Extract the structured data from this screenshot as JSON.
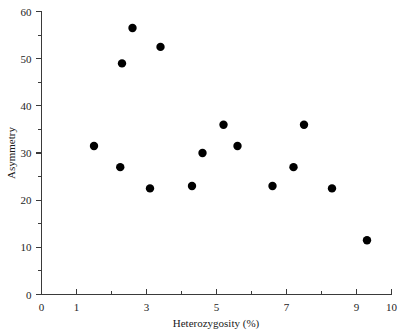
{
  "chart_data": {
    "type": "scatter",
    "title": "",
    "xlabel": "Heterozygosity (%)",
    "ylabel": "Asymmetry",
    "xlim": [
      0,
      10
    ],
    "ylim": [
      0,
      60
    ],
    "grid": false,
    "legend": "none",
    "x_ticks_major": [
      0,
      1,
      3,
      5,
      7,
      9,
      10
    ],
    "x_ticks_all": [
      0,
      1,
      2,
      3,
      4,
      5,
      6,
      7,
      8,
      9,
      10
    ],
    "x_tick_labels": [
      "0",
      "1",
      "3",
      "5",
      "7",
      "9",
      "10"
    ],
    "y_ticks_major": [
      0,
      10,
      20,
      30,
      40,
      50,
      60
    ],
    "y_ticks_minor": [
      5,
      15,
      25,
      35,
      45,
      55
    ],
    "y_tick_labels": [
      "0",
      "10",
      "20",
      "30",
      "40",
      "50",
      "60"
    ],
    "marker": "filled-circle",
    "marker_color": "#000000",
    "marker_size_px": 4.2,
    "points": [
      {
        "x": 1.5,
        "y": 31.5
      },
      {
        "x": 2.25,
        "y": 27.0
      },
      {
        "x": 2.3,
        "y": 49.0
      },
      {
        "x": 2.6,
        "y": 56.5
      },
      {
        "x": 3.1,
        "y": 22.5
      },
      {
        "x": 3.4,
        "y": 52.5
      },
      {
        "x": 4.3,
        "y": 23.0
      },
      {
        "x": 4.6,
        "y": 30.0
      },
      {
        "x": 5.2,
        "y": 36.0
      },
      {
        "x": 5.6,
        "y": 31.5
      },
      {
        "x": 6.6,
        "y": 23.0
      },
      {
        "x": 7.2,
        "y": 27.0
      },
      {
        "x": 7.5,
        "y": 36.0
      },
      {
        "x": 8.3,
        "y": 22.5
      },
      {
        "x": 9.3,
        "y": 11.5
      }
    ]
  },
  "axes": {
    "x_title": "Heterozygosity (%)",
    "y_title": "Asymmetry"
  },
  "colors": {
    "axis": "#3a3a3a",
    "marker": "#000000",
    "background": "#ffffff",
    "text": "#1a1a1a"
  }
}
